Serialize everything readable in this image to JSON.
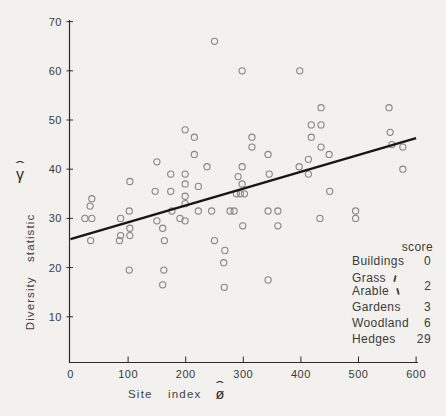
{
  "figure": {
    "background": "#f2f1ed",
    "ink": "#3a3a3a",
    "axis_color": "#2b2b2b",
    "circle_color": "#868686",
    "line_color": "#161616"
  },
  "chart_data": {
    "type": "scatter",
    "title": "",
    "xlabel": "Site index",
    "xlabel_symbol": "ø",
    "ylabel": "Diversity statistic",
    "ylabel_symbol": "γ",
    "hat_mark": "ˆ",
    "xlim": [
      0,
      620
    ],
    "ylim": [
      0,
      71
    ],
    "x_ticks": [
      0,
      100,
      200,
      300,
      400,
      500,
      600
    ],
    "y_ticks": [
      10,
      20,
      30,
      40,
      50,
      60,
      70
    ],
    "grid": "off",
    "regression_line": {
      "x1": 0,
      "y1": 25.8,
      "x2": 600,
      "y2": 46.3
    },
    "points": [
      [
        37,
        34
      ],
      [
        34,
        32.5
      ],
      [
        25,
        30
      ],
      [
        37,
        30
      ],
      [
        35,
        25.5
      ],
      [
        87,
        30
      ],
      [
        87,
        26.5
      ],
      [
        85,
        25.5
      ],
      [
        103,
        37.5
      ],
      [
        102,
        31.5
      ],
      [
        103,
        28
      ],
      [
        103,
        26.5
      ],
      [
        102,
        19.5
      ],
      [
        150,
        41.5
      ],
      [
        147,
        35.5
      ],
      [
        150,
        29.5
      ],
      [
        160,
        28
      ],
      [
        163,
        25.5
      ],
      [
        162,
        19.5
      ],
      [
        160,
        16.5
      ],
      [
        174,
        39
      ],
      [
        174,
        35.5
      ],
      [
        176,
        31.5
      ],
      [
        199,
        48
      ],
      [
        199,
        39
      ],
      [
        199,
        37
      ],
      [
        199,
        34.5
      ],
      [
        199,
        33
      ],
      [
        199,
        29.5
      ],
      [
        190,
        30
      ],
      [
        215,
        46.5
      ],
      [
        215,
        43
      ],
      [
        222,
        36.5
      ],
      [
        222,
        31.5
      ],
      [
        237,
        40.5
      ],
      [
        245,
        31.5
      ],
      [
        250,
        25.5
      ],
      [
        250,
        66
      ],
      [
        268,
        23.5
      ],
      [
        266,
        21
      ],
      [
        267,
        16
      ],
      [
        277,
        31.5
      ],
      [
        284,
        31.5
      ],
      [
        288,
        35
      ],
      [
        295,
        35
      ],
      [
        302,
        35
      ],
      [
        291,
        38.5
      ],
      [
        298,
        37
      ],
      [
        298,
        40.5
      ],
      [
        298,
        60
      ],
      [
        299,
        28.5
      ],
      [
        315,
        46.5
      ],
      [
        315,
        44.5
      ],
      [
        343,
        43
      ],
      [
        345,
        39
      ],
      [
        343,
        31.5
      ],
      [
        360,
        31.5
      ],
      [
        360,
        28.5
      ],
      [
        343,
        17.5
      ],
      [
        397,
        40.5
      ],
      [
        398,
        60
      ],
      [
        413,
        42
      ],
      [
        413,
        39
      ],
      [
        418,
        49
      ],
      [
        435,
        49
      ],
      [
        418,
        46.5
      ],
      [
        435,
        44.5
      ],
      [
        435,
        52.5
      ],
      [
        433,
        30
      ],
      [
        449,
        43
      ],
      [
        450,
        35.5
      ],
      [
        495,
        31.5
      ],
      [
        495,
        30
      ],
      [
        553,
        52.5
      ],
      [
        555,
        47.5
      ],
      [
        558,
        45
      ],
      [
        577,
        44.5
      ],
      [
        577,
        40
      ]
    ],
    "legend": {
      "header": "score",
      "items": [
        {
          "label": "Buildings",
          "score": "0"
        },
        {
          "label": "Grass",
          "score": null,
          "brace": true
        },
        {
          "label": "Arable",
          "score": null,
          "brace": true
        },
        {
          "label": "Gardens",
          "score": "3"
        },
        {
          "label": "Woodland",
          "score": "6"
        },
        {
          "label": "Hedges",
          "score": "29"
        }
      ],
      "group_score": "2"
    }
  }
}
